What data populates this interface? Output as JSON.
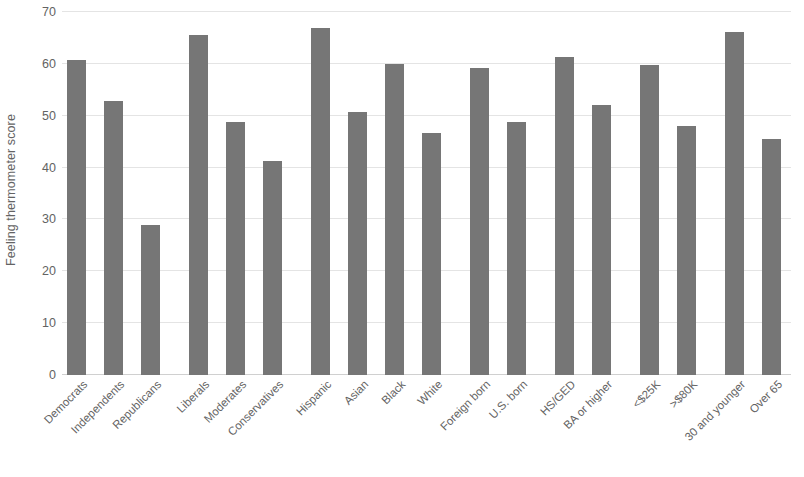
{
  "chart_data": {
    "type": "bar",
    "title": "",
    "subtitle": "",
    "xlabel": "",
    "ylabel": "Feeling thermometer score",
    "ylim": [
      0,
      70
    ],
    "ytick_step": 10,
    "yticks": [
      70,
      60,
      50,
      40,
      30,
      20,
      10,
      0
    ],
    "grid": true,
    "legend": "none",
    "bar_color": "#767676",
    "gridline_color": "#e4e4e4",
    "text_color": "#636363",
    "orientation": "vertical",
    "x_label_rotation": -45,
    "categories": [
      "Democrats",
      "Independents",
      "Republicans",
      "Liberals",
      "Moderates",
      "Conservatives",
      "Hispanic",
      "Asian",
      "Black",
      "White",
      "Foreign born",
      "U.S. born",
      "HS/GED",
      "BA or higher",
      "<$25K",
      ">$80K",
      "30 and younger",
      "Over 65",
      "Male",
      "Female"
    ],
    "values": [
      60.8,
      52.8,
      29.0,
      65.6,
      48.7,
      41.2,
      66.9,
      50.7,
      59.9,
      46.6,
      59.2,
      48.7,
      61.4,
      52.0,
      59.8,
      48.1,
      66.1,
      45.5,
      51.4,
      49.5
    ],
    "groups": [
      {
        "name": "Party identification",
        "categories": [
          "Democrats",
          "Independents",
          "Republicans"
        ],
        "values": [
          60.8,
          52.8,
          29.0
        ]
      },
      {
        "name": "Ideology",
        "categories": [
          "Liberals",
          "Moderates",
          "Conservatives"
        ],
        "values": [
          65.6,
          48.7,
          41.2
        ]
      },
      {
        "name": "Race and ethnicity",
        "categories": [
          "Hispanic",
          "Asian",
          "Black",
          "White"
        ],
        "values": [
          66.9,
          50.7,
          59.9,
          46.6
        ]
      },
      {
        "name": "Nativity",
        "categories": [
          "Foreign born",
          "U.S. born"
        ],
        "values": [
          59.2,
          48.7
        ]
      },
      {
        "name": "Education",
        "categories": [
          "HS/GED",
          "BA or higher"
        ],
        "values": [
          61.4,
          52.0
        ]
      },
      {
        "name": "Income",
        "categories": [
          "<$25K",
          ">$80K"
        ],
        "values": [
          59.8,
          48.1
        ]
      },
      {
        "name": "Age",
        "categories": [
          "30 and younger",
          "Over 65"
        ],
        "values": [
          66.1,
          45.5
        ]
      },
      {
        "name": "Gender",
        "categories": [
          "Male",
          "Female"
        ],
        "values": [
          51.4,
          49.5
        ]
      }
    ]
  }
}
